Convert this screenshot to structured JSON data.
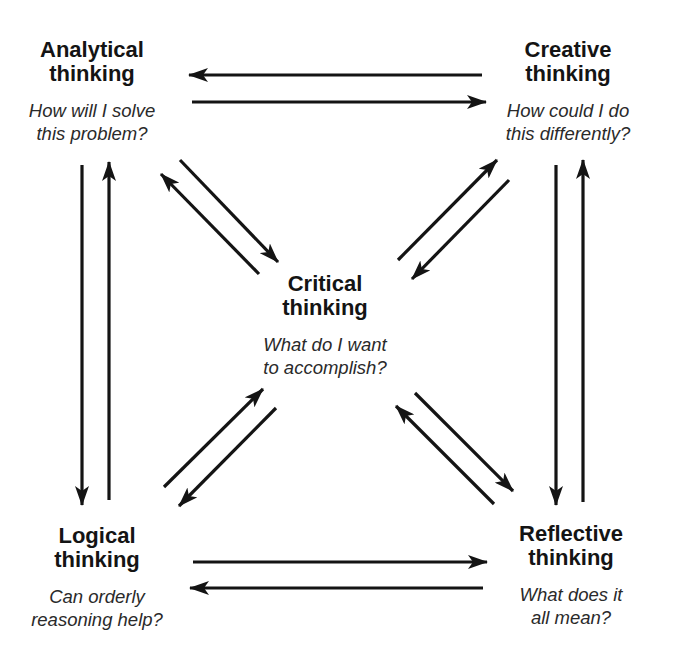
{
  "diagram": {
    "type": "thinking-modes-cycle",
    "nodes": [
      {
        "id": "analytical",
        "title_line1": "Analytical",
        "title_line2": "thinking",
        "question_line1": "How will I solve",
        "question_line2": "this problem?",
        "position": "top-left"
      },
      {
        "id": "creative",
        "title_line1": "Creative",
        "title_line2": "thinking",
        "question_line1": "How could I do",
        "question_line2": "this differently?",
        "position": "top-right"
      },
      {
        "id": "critical",
        "title_line1": "Critical",
        "title_line2": "thinking",
        "question_line1": "What do I want",
        "question_line2": "to accomplish?",
        "position": "center"
      },
      {
        "id": "logical",
        "title_line1": "Logical",
        "title_line2": "thinking",
        "question_line1": "Can orderly",
        "question_line2": "reasoning help?",
        "position": "bottom-left"
      },
      {
        "id": "reflective",
        "title_line1": "Reflective",
        "title_line2": "thinking",
        "question_line1": "What does it",
        "question_line2": "all mean?",
        "position": "bottom-right"
      }
    ],
    "edges": [
      {
        "from": "creative",
        "to": "analytical"
      },
      {
        "from": "analytical",
        "to": "creative"
      },
      {
        "from": "analytical",
        "to": "logical"
      },
      {
        "from": "logical",
        "to": "analytical"
      },
      {
        "from": "creative",
        "to": "reflective"
      },
      {
        "from": "reflective",
        "to": "creative"
      },
      {
        "from": "logical",
        "to": "reflective"
      },
      {
        "from": "reflective",
        "to": "logical"
      },
      {
        "from": "analytical",
        "to": "critical"
      },
      {
        "from": "critical",
        "to": "analytical"
      },
      {
        "from": "critical",
        "to": "creative"
      },
      {
        "from": "creative",
        "to": "critical"
      },
      {
        "from": "logical",
        "to": "critical"
      },
      {
        "from": "critical",
        "to": "logical"
      },
      {
        "from": "critical",
        "to": "reflective"
      },
      {
        "from": "reflective",
        "to": "critical"
      }
    ],
    "colors": {
      "background": "#ffffff",
      "ink": "#141414"
    }
  }
}
